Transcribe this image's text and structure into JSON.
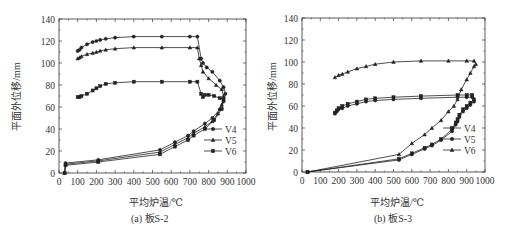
{
  "figure": {
    "panels": [
      {
        "caption": "(a) 板S-2",
        "xlabel": "平均炉温/℃",
        "ylabel": "平面外位移/mm"
      },
      {
        "caption": "(b) 板S-3",
        "xlabel": "平均炉温/℃",
        "ylabel": "平面外位移/mm"
      }
    ]
  },
  "chart_data": [
    {
      "type": "line",
      "title": "(a) 板S-2",
      "xlabel": "平均炉温/℃",
      "ylabel": "平面外位移/mm",
      "xlim": [
        0,
        1000
      ],
      "ylim": [
        0,
        140
      ],
      "xticks": [
        0,
        100,
        200,
        300,
        400,
        500,
        600,
        700,
        800,
        900,
        1000
      ],
      "yticks": [
        0,
        20,
        40,
        60,
        80,
        100,
        120,
        140
      ],
      "grid": false,
      "legend_position": "lower right",
      "series": [
        {
          "name": "V4",
          "marker": "circle",
          "x": [
            30,
            35,
            210,
            540,
            620,
            690,
            720,
            780,
            820,
            860,
            880,
            890,
            880,
            860,
            820,
            790,
            770,
            760,
            740,
            700,
            550,
            400,
            300,
            250,
            220,
            200,
            180,
            150,
            120,
            110,
            100
          ],
          "y": [
            0,
            9,
            12,
            21,
            28,
            34,
            38,
            45,
            50,
            58,
            65,
            72,
            78,
            84,
            92,
            96,
            100,
            104,
            124,
            124,
            124,
            124,
            123,
            122,
            121,
            120,
            119,
            117,
            114,
            112,
            111
          ]
        },
        {
          "name": "V5",
          "marker": "triangle",
          "x": [
            30,
            35,
            210,
            540,
            620,
            690,
            720,
            780,
            820,
            850,
            870,
            880,
            870,
            840,
            800,
            770,
            760,
            750,
            740,
            700,
            550,
            400,
            300,
            250,
            220,
            200,
            180,
            150,
            120,
            110,
            100
          ],
          "y": [
            0,
            8,
            11,
            19,
            26,
            32,
            36,
            42,
            47,
            54,
            62,
            70,
            76,
            80,
            86,
            92,
            98,
            104,
            114,
            114,
            114,
            114,
            113,
            112,
            111,
            110,
            109,
            108,
            106,
            105,
            104
          ]
        },
        {
          "name": "V6",
          "marker": "square",
          "x": [
            30,
            35,
            210,
            540,
            620,
            690,
            720,
            780,
            830,
            870,
            880,
            860,
            830,
            800,
            780,
            770,
            760,
            740,
            700,
            550,
            400,
            300,
            250,
            220,
            200,
            180,
            150,
            120,
            110,
            100
          ],
          "y": [
            0,
            7,
            10,
            17,
            24,
            30,
            34,
            40,
            48,
            58,
            67,
            68,
            70,
            71,
            71,
            69,
            72,
            83,
            83,
            83,
            83,
            82,
            81,
            79,
            77,
            75,
            72,
            70,
            69,
            69
          ]
        }
      ]
    },
    {
      "type": "line",
      "title": "(b) 板S-3",
      "xlabel": "平均炉温/℃",
      "ylabel": "平面外位移/mm",
      "xlim": [
        0,
        1000
      ],
      "ylim": [
        0,
        140
      ],
      "xticks": [
        0,
        100,
        200,
        300,
        400,
        500,
        600,
        700,
        800,
        900,
        1000
      ],
      "yticks": [
        0,
        20,
        40,
        60,
        80,
        100,
        120,
        140
      ],
      "grid": false,
      "legend_position": "lower right",
      "series": [
        {
          "name": "V4",
          "marker": "square",
          "x": [
            30,
            530,
            600,
            670,
            710,
            760,
            820,
            840,
            850,
            860,
            880,
            900,
            920,
            940,
            930,
            900,
            850,
            650,
            500,
            400,
            350,
            300,
            250,
            220,
            200,
            190,
            180
          ],
          "y": [
            0,
            12,
            17,
            22,
            25,
            30,
            39,
            45,
            48,
            52,
            57,
            60,
            63,
            66,
            70,
            70,
            70,
            69,
            68,
            67,
            66,
            64,
            62,
            60,
            58,
            56,
            54
          ]
        },
        {
          "name": "V5",
          "marker": "circle",
          "x": [
            30,
            530,
            600,
            670,
            710,
            760,
            820,
            840,
            850,
            860,
            880,
            900,
            920,
            940,
            930,
            900,
            850,
            650,
            500,
            400,
            350,
            300,
            250,
            220,
            200,
            190,
            180
          ],
          "y": [
            0,
            11,
            16,
            21,
            24,
            29,
            37,
            43,
            46,
            50,
            55,
            58,
            61,
            64,
            68,
            68,
            68,
            67,
            66,
            65,
            64,
            62,
            60,
            58,
            57,
            55,
            53
          ]
        },
        {
          "name": "V6",
          "marker": "triangle",
          "x": [
            30,
            530,
            600,
            670,
            710,
            760,
            800,
            830,
            850,
            870,
            900,
            920,
            940,
            950,
            940,
            900,
            800,
            650,
            500,
            400,
            350,
            300,
            250,
            220,
            200,
            180
          ],
          "y": [
            0,
            16,
            26,
            34,
            40,
            47,
            55,
            60,
            66,
            75,
            84,
            90,
            96,
            98,
            101,
            101,
            101,
            101,
            100,
            98,
            96,
            94,
            91,
            89,
            88,
            86
          ]
        }
      ]
    }
  ]
}
